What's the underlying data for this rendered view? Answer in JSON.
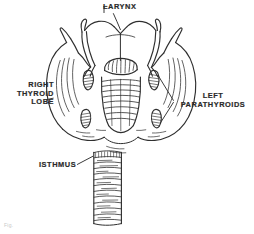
{
  "figure": {
    "background_color": "#ffffff",
    "ink_color": "#2a2a2a",
    "caption_mark": "Fig."
  },
  "labels": {
    "larynx": {
      "text": "LARYNX",
      "name": "larynx"
    },
    "right_thyroid_lobe": {
      "line1": "RIGHT",
      "line2": "THYROID",
      "line3": "LOBE",
      "name": "right-thyroid-lobe"
    },
    "left_parathyroids": {
      "line1": "LEFT",
      "line2": "PARATHYROIDS",
      "name": "left-parathyroids"
    },
    "isthmus": {
      "text": "ISTHMUS",
      "name": "isthmus"
    }
  },
  "structures": [
    {
      "name": "larynx",
      "description": "thyroid cartilage with superior notch and horns"
    },
    {
      "name": "right-thyroid-lobe",
      "description": "large rounded lobe on viewer left"
    },
    {
      "name": "left-thyroid-lobe",
      "description": "large rounded lobe on viewer right"
    },
    {
      "name": "isthmus",
      "description": "narrow band joining the two lobes"
    },
    {
      "name": "trachea",
      "description": "vertical tube with cartilage rings"
    },
    {
      "name": "parathyroid-superior-right",
      "description": "hatched oval gland"
    },
    {
      "name": "parathyroid-inferior-right",
      "description": "hatched oval gland"
    },
    {
      "name": "parathyroid-superior-left",
      "description": "hatched oval gland"
    },
    {
      "name": "parathyroid-inferior-left",
      "description": "hatched oval gland"
    },
    {
      "name": "cricoid-cartilage",
      "description": "central ringed cartilage below larynx"
    }
  ]
}
